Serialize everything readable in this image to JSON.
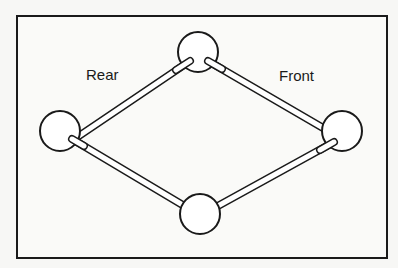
{
  "labels": {
    "rear": "Rear",
    "front": "Front"
  },
  "nodes": [
    {
      "id": "left",
      "cx": 60,
      "cy": 131,
      "r": 20
    },
    {
      "id": "top",
      "cx": 198,
      "cy": 52,
      "r": 20
    },
    {
      "id": "right",
      "cx": 342,
      "cy": 131,
      "r": 20
    },
    {
      "id": "bottom",
      "cx": 200,
      "cy": 214,
      "r": 20
    }
  ],
  "colors": {
    "stroke": "#1a1a1a",
    "fill": "#ffffff",
    "background": "#f7f7f5"
  }
}
